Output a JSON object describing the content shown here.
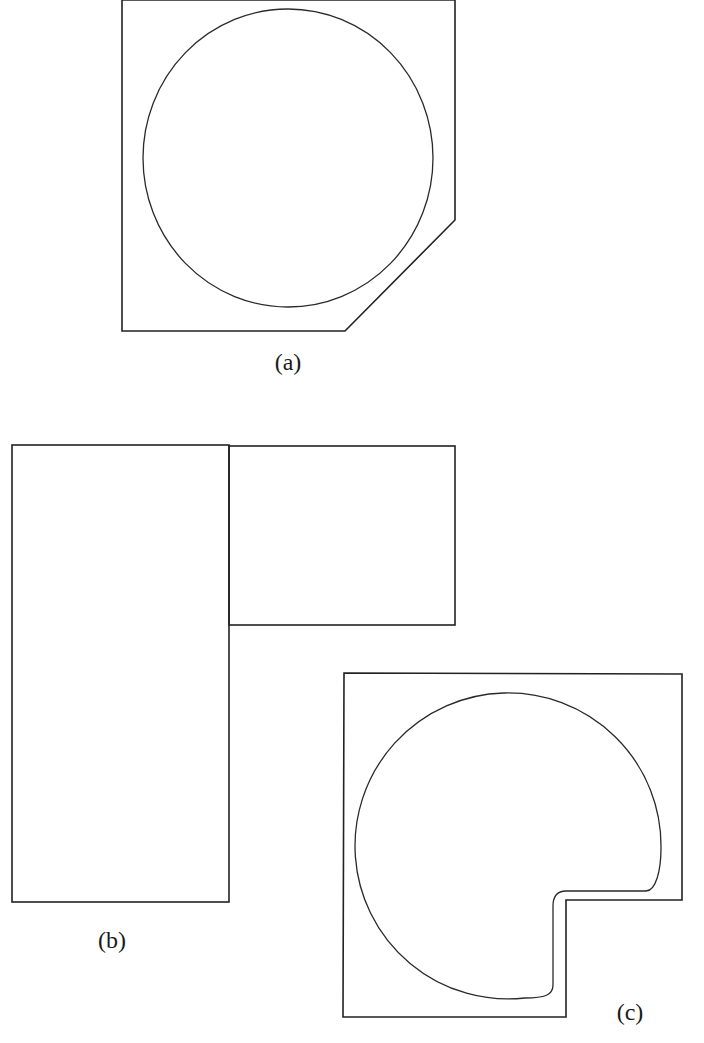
{
  "diagram": {
    "colors": {
      "background": "#ffffff",
      "stroke": "#222222",
      "text": "#1a1a1a"
    },
    "figures": [
      {
        "id": "a",
        "label": "(a)",
        "description": "Polygon container with chamfered bottom-right corner enclosing a circle",
        "outline_points": [
          [
            122,
            0
          ],
          [
            122,
            331
          ],
          [
            345,
            331
          ],
          [
            455,
            220
          ],
          [
            455,
            0
          ]
        ],
        "circle": {
          "cx": 288,
          "cy": 158,
          "rx": 145,
          "ry": 149
        },
        "label_pos": [
          288,
          362
        ]
      },
      {
        "id": "b",
        "label": "(b)",
        "description": "Tall rectangle adjoined by a smaller rectangle at its upper right",
        "rects": [
          {
            "x": 12,
            "y": 445,
            "w": 217,
            "h": 457
          },
          {
            "x": 229,
            "y": 446,
            "w": 226,
            "h": 179
          }
        ],
        "label_pos": [
          112,
          940
        ]
      },
      {
        "id": "c",
        "label": "(c)",
        "description": "L-shaped container with notch at bottom-right enclosing a circle truncated to fit the notch",
        "outline_points": [
          [
            344,
            673
          ],
          [
            682,
            674
          ],
          [
            682,
            900
          ],
          [
            566,
            900
          ],
          [
            566,
            1017
          ],
          [
            343,
            1017
          ]
        ],
        "inner_path": "M 553 985 C 553 995 545 998 525 998 A 153 153 0 1 1 661 848 C 661 870 656 891 646 891 L 566 891 C 557 891 553 897 553 906 Z",
        "label_pos": [
          630,
          1020
        ]
      }
    ]
  }
}
